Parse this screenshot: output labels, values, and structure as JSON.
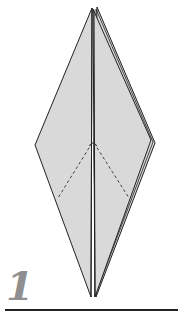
{
  "diagram": {
    "step_number": "1",
    "colors": {
      "paper_fill": "#d9d9d9",
      "outline": "#222222",
      "step_number": "#8f8f8f",
      "background": "#ffffff"
    },
    "shape": "kite/diamond base with center fold and dashed valley-fold guides"
  }
}
